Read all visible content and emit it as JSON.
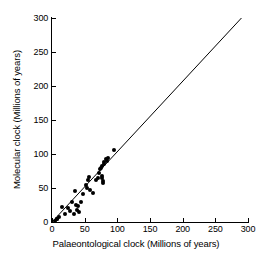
{
  "chart_data": {
    "type": "scatter",
    "title": "",
    "xlabel": "Palaeontological clock (Millions of years)",
    "ylabel": "Molecular clock (Millions of years)",
    "xlim": [
      0,
      300
    ],
    "ylim": [
      0,
      300
    ],
    "xticks": [
      0,
      50,
      100,
      150,
      200,
      250,
      300
    ],
    "yticks": [
      0,
      50,
      100,
      150,
      200,
      250,
      300
    ],
    "xtick_labels": [
      "0",
      "50",
      "100",
      "150",
      "200",
      "250",
      "300"
    ],
    "ytick_labels": [
      "0",
      "50",
      "100",
      "150",
      "200",
      "250",
      "300"
    ],
    "grid": false,
    "legend": "none",
    "marker": "filled-circle",
    "marker_color": "#000000",
    "line_color": "#000000",
    "background_color": "#ffffff",
    "axis_color": "#000000",
    "reference_line": {
      "name": "identity-line",
      "description": "1:1 line of equality",
      "x": [
        0,
        290
      ],
      "y": [
        0,
        300
      ]
    },
    "series": [
      {
        "name": "species pairs",
        "points": [
          [
            5,
            2
          ],
          [
            7,
            4
          ],
          [
            8,
            5
          ],
          [
            10,
            7
          ],
          [
            16,
            22
          ],
          [
            20,
            12
          ],
          [
            24,
            20
          ],
          [
            28,
            16
          ],
          [
            30,
            30
          ],
          [
            33,
            12
          ],
          [
            35,
            45
          ],
          [
            36,
            25
          ],
          [
            38,
            18
          ],
          [
            40,
            24
          ],
          [
            42,
            14
          ],
          [
            44,
            30
          ],
          [
            47,
            41
          ],
          [
            52,
            55
          ],
          [
            54,
            50
          ],
          [
            55,
            62
          ],
          [
            57,
            66
          ],
          [
            58,
            47
          ],
          [
            62,
            43
          ],
          [
            68,
            62
          ],
          [
            70,
            65
          ],
          [
            72,
            72
          ],
          [
            74,
            78
          ],
          [
            75,
            80
          ],
          [
            76,
            82
          ],
          [
            77,
            68
          ],
          [
            77,
            64
          ],
          [
            78,
            60
          ],
          [
            78,
            58
          ],
          [
            79,
            85
          ],
          [
            80,
            88
          ],
          [
            82,
            92
          ],
          [
            84,
            90
          ],
          [
            86,
            94
          ],
          [
            95,
            106
          ]
        ]
      }
    ]
  }
}
